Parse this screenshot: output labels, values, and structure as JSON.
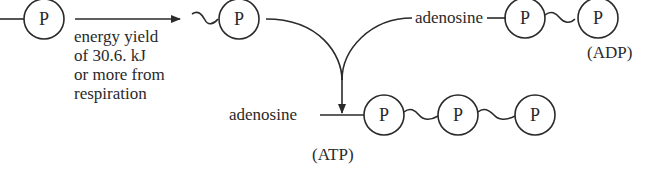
{
  "diagram": {
    "phosphate_symbol": "P",
    "energy_label": [
      "energy yield",
      "of 30.6. kJ",
      "or more from",
      "respiration"
    ],
    "adp": {
      "molecule_label": "adenosine",
      "name": "(ADP)"
    },
    "atp": {
      "molecule_label": "adenosine",
      "name": "(ATP)"
    },
    "colors": {
      "ink": "#2a2a2a",
      "background": "#ffffff"
    }
  }
}
